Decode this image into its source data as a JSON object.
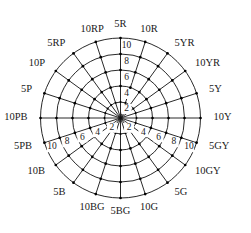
{
  "figure": {
    "background_color": "#ffffff",
    "line_color": "#111111",
    "node_color": "#000000",
    "text_color": "#1a1a1a"
  },
  "chart_data": {
    "type": "scatter",
    "subtype": "polar-grid",
    "title": "",
    "xlabel": "",
    "ylabel": "",
    "grid": true,
    "legend_position": "none",
    "center": {
      "x": 120.5,
      "y": 118
    },
    "outer_radius": 80,
    "angle_labels": [
      {
        "label": "5R",
        "angle_deg": 90
      },
      {
        "label": "10R",
        "angle_deg": 72
      },
      {
        "label": "5YR",
        "angle_deg": 54
      },
      {
        "label": "10YR",
        "angle_deg": 36
      },
      {
        "label": "5Y",
        "angle_deg": 18
      },
      {
        "label": "10Y",
        "angle_deg": 0
      },
      {
        "label": "5GY",
        "angle_deg": -18
      },
      {
        "label": "10GY",
        "angle_deg": -36
      },
      {
        "label": "5G",
        "angle_deg": -54
      },
      {
        "label": "10G",
        "angle_deg": -72
      },
      {
        "label": "5BG",
        "angle_deg": -90
      },
      {
        "label": "10BG",
        "angle_deg": -108
      },
      {
        "label": "5B",
        "angle_deg": -126
      },
      {
        "label": "10B",
        "angle_deg": -144
      },
      {
        "label": "5PB",
        "angle_deg": -162
      },
      {
        "label": "10PB",
        "angle_deg": 180
      },
      {
        "label": "5P",
        "angle_deg": 162
      },
      {
        "label": "10P",
        "angle_deg": 144
      },
      {
        "label": "5RP",
        "angle_deg": 126
      },
      {
        "label": "10RP",
        "angle_deg": 108
      }
    ],
    "radial_ticks": [
      {
        "value": 2,
        "radius": 16
      },
      {
        "value": 4,
        "radius": 32
      },
      {
        "value": 6,
        "radius": 48
      },
      {
        "value": 8,
        "radius": 64
      },
      {
        "value": 10,
        "radius": 80
      }
    ],
    "radial_tick_labels_vertical": [
      "10",
      "8",
      "6",
      "4",
      "2"
    ],
    "radial_tick_labels_lower_right": [
      "2",
      "4",
      "6",
      "8",
      "10"
    ],
    "radial_tick_labels_lower_left": [
      "2",
      "4",
      "6",
      "8",
      "10"
    ],
    "n_spokes": 20,
    "n_rings": 5,
    "labeled_axes": [
      {
        "name": "vertical-up",
        "angle_deg": 90,
        "ticks": [
          "2",
          "4",
          "6",
          "8",
          "10"
        ]
      },
      {
        "name": "lower-right-diagonal",
        "angle_deg": -18,
        "ticks": [
          "2",
          "4",
          "6",
          "8",
          "10"
        ]
      },
      {
        "name": "lower-left-diagonal",
        "angle_deg": -162,
        "ticks": [
          "2",
          "4",
          "6",
          "8",
          "10"
        ]
      }
    ]
  }
}
